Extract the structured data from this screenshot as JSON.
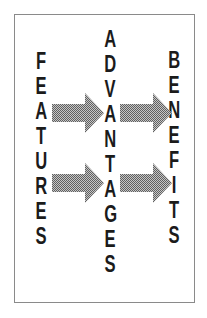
{
  "page": {
    "background": "#ffffff"
  },
  "diagram": {
    "frame": {
      "border_color": "#8a8a8a"
    },
    "columns": [
      {
        "id": "features",
        "word": "FEATURES"
      },
      {
        "id": "advantages",
        "word": "ADVANTAGES"
      },
      {
        "id": "benefits",
        "word": "BENEFITS"
      }
    ],
    "arrows": {
      "direction": "right",
      "count": 4,
      "fill_style": "halftone-dither",
      "dither_dark": "#606060",
      "dither_light": "#c6c6c6"
    },
    "text_color": "#1b1b1b"
  }
}
